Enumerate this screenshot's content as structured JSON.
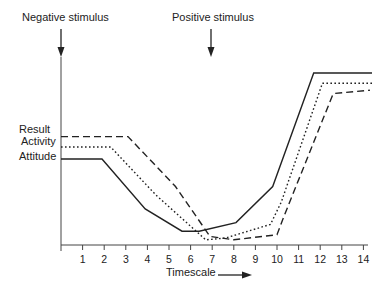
{
  "chart_data": {
    "type": "line",
    "title": "",
    "xlabel": "Timescale",
    "ylabel": "",
    "x_ticks": [
      1,
      2,
      3,
      4,
      5,
      6,
      7,
      8,
      9,
      10,
      11,
      12,
      13,
      14
    ],
    "xlim": [
      0,
      14.5
    ],
    "ylim": [
      0,
      100
    ],
    "grid": false,
    "legend": "none (series labeled at left of y-axis)",
    "y_axis_labels": [
      "Result",
      "Activity",
      "Attitude"
    ],
    "annotations": [
      {
        "text": "Negative stimulus",
        "x": 0,
        "arrow": "down"
      },
      {
        "text": "Positive stimulus",
        "x": 7,
        "arrow": "down"
      }
    ],
    "series": [
      {
        "name": "Attitude",
        "style": "solid",
        "points": [
          [
            0,
            50
          ],
          [
            1.9,
            50
          ],
          [
            3.9,
            21
          ],
          [
            5.6,
            8
          ],
          [
            6.4,
            8
          ],
          [
            8.1,
            13
          ],
          [
            9.8,
            34
          ],
          [
            11.7,
            100
          ],
          [
            14.4,
            100
          ]
        ]
      },
      {
        "name": "Activity",
        "style": "dotted",
        "points": [
          [
            0,
            57
          ],
          [
            2.3,
            57
          ],
          [
            4.4,
            29
          ],
          [
            6.7,
            3
          ],
          [
            7.6,
            4
          ],
          [
            9.7,
            12
          ],
          [
            10.2,
            25
          ],
          [
            12.1,
            94
          ],
          [
            14.4,
            94
          ]
        ]
      },
      {
        "name": "Result",
        "style": "dashed",
        "points": [
          [
            0,
            63
          ],
          [
            3.1,
            63
          ],
          [
            5.3,
            34
          ],
          [
            6.9,
            5
          ],
          [
            8,
            3
          ],
          [
            10,
            6
          ],
          [
            10.3,
            16
          ],
          [
            12.6,
            88
          ],
          [
            14.3,
            90
          ]
        ]
      }
    ]
  },
  "labels": {
    "negative_stimulus": "Negative stimulus",
    "positive_stimulus": "Positive stimulus",
    "result": "Result",
    "activity": "Activity",
    "attitude": "Attitude",
    "timescale": "Timescale"
  }
}
